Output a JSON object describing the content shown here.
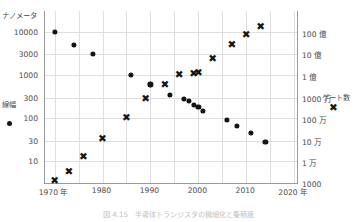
{
  "chart_data": {
    "type": "scatter",
    "title": "",
    "xlabel": "",
    "x_axis": {
      "min": 1968,
      "max": 2021,
      "ticks": [
        1970,
        1980,
        1990,
        2000,
        2010,
        2020
      ],
      "tick_labels": [
        "1970 年",
        "1980",
        "1990",
        "2000",
        "2010",
        "2020 年"
      ],
      "minor_gridlines": [
        1975,
        1985,
        1995,
        2005,
        2015
      ],
      "grid": true
    },
    "y_axis_left": {
      "title": "ナノメータ",
      "scale": "log",
      "tick_labels": [
        "10000",
        "3000",
        "1000",
        "300",
        "100",
        "30",
        "10"
      ],
      "tick_values": [
        10000,
        3000,
        1000,
        300,
        100,
        30,
        10
      ],
      "min": 3,
      "max": 30000
    },
    "y_axis_right": {
      "title": "",
      "scale": "log",
      "tick_labels": [
        "100 億",
        "10 億",
        "1 億",
        "1000 万",
        "100 万",
        "10 万",
        "1 万",
        "1000"
      ],
      "tick_values": [
        10000000000,
        1000000000,
        100000000,
        10000000,
        1000000,
        100000,
        10000,
        1000
      ],
      "min": 1000,
      "max": 100000000000
    },
    "legend": [
      {
        "name": "線幅",
        "marker": "filled-circle",
        "axis": "left",
        "position": "left-middle"
      },
      {
        "name": "ゲート数",
        "marker": "cross-x",
        "axis": "right",
        "position": "right-middle"
      }
    ],
    "series": [
      {
        "name": "線幅",
        "marker": "filled-circle",
        "axis": "left",
        "unit": "ナノメータ",
        "points": [
          {
            "x": 1970,
            "y": 10000
          },
          {
            "x": 1974,
            "y": 5000
          },
          {
            "x": 1978,
            "y": 3000
          },
          {
            "x": 1986,
            "y": 1000
          },
          {
            "x": 1990,
            "y": 600
          },
          {
            "x": 1994,
            "y": 350
          },
          {
            "x": 1997,
            "y": 280
          },
          {
            "x": 1998,
            "y": 250
          },
          {
            "x": 1999,
            "y": 200
          },
          {
            "x": 2000,
            "y": 180
          },
          {
            "x": 2001,
            "y": 150
          },
          {
            "x": 2006,
            "y": 90
          },
          {
            "x": 2008,
            "y": 65
          },
          {
            "x": 2011,
            "y": 45
          },
          {
            "x": 2014,
            "y": 28
          }
        ]
      },
      {
        "name": "ゲート数",
        "marker": "cross-x",
        "axis": "right",
        "points": [
          {
            "x": 1970,
            "y": 1500
          },
          {
            "x": 1973,
            "y": 4000
          },
          {
            "x": 1976,
            "y": 20000
          },
          {
            "x": 1980,
            "y": 130000
          },
          {
            "x": 1985,
            "y": 1300000
          },
          {
            "x": 1989,
            "y": 9000000
          },
          {
            "x": 1993,
            "y": 40000000
          },
          {
            "x": 1996,
            "y": 120000000
          },
          {
            "x": 1999,
            "y": 130000000
          },
          {
            "x": 2000,
            "y": 150000000
          },
          {
            "x": 2003,
            "y": 700000000
          },
          {
            "x": 2007,
            "y": 3000000000
          },
          {
            "x": 2010,
            "y": 9000000000
          },
          {
            "x": 2013,
            "y": 20000000000
          }
        ]
      }
    ],
    "colors": {
      "marker": "#141414",
      "grid": "#dfdfdf",
      "axis": "#9a9a9a",
      "text": "#4a4a4a"
    }
  },
  "caption": {
    "text": "図 4.15　半導体トランジスタの微細化と集積度"
  }
}
